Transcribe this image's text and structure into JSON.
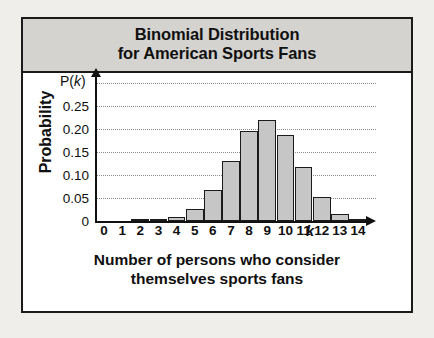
{
  "figure": {
    "title_lines": [
      "Binomial Distribution",
      "for American Sports Fans"
    ],
    "caption_lines": [
      "Number of persons who consider",
      "themselves sports fans"
    ],
    "y_axis_title": "Probability",
    "y_axis_symbol": "P(k)",
    "x_axis_symbol": "k",
    "colors": {
      "bar_fill": "#c6c6c6",
      "bar_border": "#1b1b1b",
      "title_band": "#d4d3cf",
      "frame": "#1b1b1b",
      "gridline": "#8d8d8d",
      "page_background": "#efeeea"
    }
  },
  "chart_data": {
    "type": "bar",
    "title": "Binomial Distribution for American Sports Fans",
    "xlabel": "Number of persons who consider themselves sports fans",
    "ylabel": "Probability",
    "x_symbol": "k",
    "y_symbol": "P(k)",
    "categories": [
      0,
      1,
      2,
      3,
      4,
      5,
      6,
      7,
      8,
      9,
      10,
      11,
      12,
      13,
      14
    ],
    "values": [
      0,
      0,
      0.001,
      0.003,
      0.009,
      0.027,
      0.067,
      0.131,
      0.195,
      0.22,
      0.187,
      0.118,
      0.051,
      0.015,
      0.002
    ],
    "xtick_labels": [
      "0",
      "1",
      "2",
      "3",
      "4",
      "5",
      "6",
      "7",
      "8",
      "9",
      "10",
      "11",
      "12",
      "13",
      "14"
    ],
    "ytick_labels": [
      "0",
      "0.05",
      "0.10",
      "0.15",
      "0.20",
      "0.25"
    ],
    "ytick_values": [
      0,
      0.05,
      0.1,
      0.15,
      0.2,
      0.25
    ],
    "ylim": [
      0,
      0.3
    ],
    "xlim": [
      -0.5,
      14.5
    ],
    "grid": true,
    "grid_axis": "y",
    "legend": false
  }
}
